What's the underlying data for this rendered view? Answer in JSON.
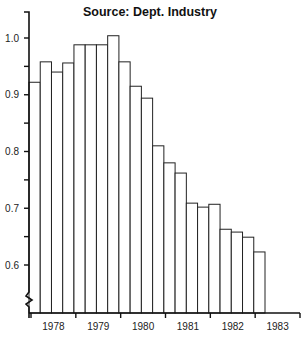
{
  "chart_data": {
    "type": "bar",
    "title": "Source: Dept. Industry",
    "xlabel": "",
    "ylabel": "",
    "ylim": [
      0.55,
      1.05
    ],
    "y_axis_break": true,
    "grid": false,
    "legend": null,
    "y_ticks": [
      {
        "value": 1.0,
        "label": "1.0"
      },
      {
        "value": 0.95,
        "label": ""
      },
      {
        "value": 0.9,
        "label": "0.9"
      },
      {
        "value": 0.85,
        "label": ""
      },
      {
        "value": 0.8,
        "label": "0.8"
      },
      {
        "value": 0.75,
        "label": ""
      },
      {
        "value": 0.7,
        "label": "0.7"
      },
      {
        "value": 0.65,
        "label": ""
      },
      {
        "value": 0.6,
        "label": "0.6"
      }
    ],
    "x_year_labels": [
      "1978",
      "1979",
      "1980",
      "1981",
      "1982",
      "1983"
    ],
    "categories": [
      "1978 Q1",
      "1978 Q2",
      "1978 Q3",
      "1978 Q4",
      "1979 Q1",
      "1979 Q2",
      "1979 Q3",
      "1979 Q4",
      "1980 Q1",
      "1980 Q2",
      "1980 Q3",
      "1980 Q4",
      "1981 Q1",
      "1981 Q2",
      "1981 Q3",
      "1981 Q4",
      "1982 Q1",
      "1982 Q2",
      "1982 Q3",
      "1982 Q4",
      "1983 Q1"
    ],
    "values": [
      0.922,
      0.958,
      0.94,
      0.956,
      0.988,
      0.988,
      0.988,
      1.004,
      0.958,
      0.915,
      0.894,
      0.81,
      0.78,
      0.762,
      0.709,
      0.702,
      0.707,
      0.663,
      0.658,
      0.649,
      0.623
    ]
  }
}
